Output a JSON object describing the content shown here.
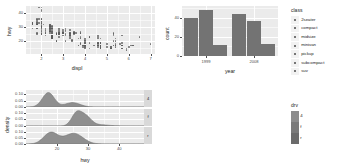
{
  "chart_data": [
    {
      "id": "scatter-displ-hwy",
      "type": "scatter",
      "title": "",
      "xlabel": "displ",
      "ylabel": "hwy",
      "xlim": [
        1.3,
        7.2
      ],
      "ylim": [
        11,
        45
      ],
      "xticks": [
        2,
        3,
        4,
        5,
        6,
        7
      ],
      "yticks": [
        20,
        30,
        40
      ],
      "grid": true,
      "legend": "right",
      "points": [
        [
          1.8,
          29
        ],
        [
          1.8,
          29
        ],
        [
          2.0,
          31
        ],
        [
          2.0,
          30
        ],
        [
          2.8,
          26
        ],
        [
          2.8,
          26
        ],
        [
          3.1,
          27
        ],
        [
          1.8,
          26
        ],
        [
          1.8,
          25
        ],
        [
          2.0,
          28
        ],
        [
          2.0,
          27
        ],
        [
          2.8,
          25
        ],
        [
          2.8,
          25
        ],
        [
          3.1,
          25
        ],
        [
          3.1,
          24
        ],
        [
          2.8,
          23
        ],
        [
          3.1,
          20
        ],
        [
          4.2,
          15
        ],
        [
          5.3,
          20
        ],
        [
          5.3,
          17
        ],
        [
          5.3,
          17
        ],
        [
          5.7,
          17
        ],
        [
          6.0,
          16
        ],
        [
          5.7,
          17
        ],
        [
          5.7,
          17
        ],
        [
          6.2,
          17
        ],
        [
          6.2,
          17
        ],
        [
          7.0,
          18
        ],
        [
          5.3,
          25
        ],
        [
          5.3,
          24
        ],
        [
          5.7,
          24
        ],
        [
          6.5,
          23
        ],
        [
          2.4,
          31
        ],
        [
          2.4,
          30
        ],
        [
          3.1,
          28
        ],
        [
          3.5,
          27
        ],
        [
          3.6,
          26
        ],
        [
          2.4,
          27
        ],
        [
          3.0,
          26
        ],
        [
          3.3,
          25
        ],
        [
          3.3,
          25
        ],
        [
          3.3,
          24
        ],
        [
          3.3,
          24
        ],
        [
          3.3,
          22
        ],
        [
          3.8,
          23
        ],
        [
          3.8,
          22
        ],
        [
          3.8,
          22
        ],
        [
          4.0,
          22
        ],
        [
          3.7,
          17
        ],
        [
          3.7,
          17
        ],
        [
          3.9,
          16
        ],
        [
          3.9,
          17
        ],
        [
          4.7,
          17
        ],
        [
          4.7,
          15
        ],
        [
          4.7,
          15
        ],
        [
          5.2,
          15
        ],
        [
          5.2,
          16
        ],
        [
          3.9,
          17
        ],
        [
          4.7,
          16
        ],
        [
          4.7,
          17
        ],
        [
          4.7,
          15
        ],
        [
          5.2,
          15
        ],
        [
          5.7,
          15
        ],
        [
          5.9,
          14
        ],
        [
          4.7,
          17
        ],
        [
          4.7,
          17
        ],
        [
          4.7,
          17
        ],
        [
          4.7,
          16
        ],
        [
          4.7,
          16
        ],
        [
          4.7,
          17
        ],
        [
          5.2,
          15
        ],
        [
          5.2,
          16
        ],
        [
          5.7,
          15
        ],
        [
          5.9,
          15
        ],
        [
          4.6,
          17
        ],
        [
          5.4,
          16
        ],
        [
          5.4,
          17
        ],
        [
          4.0,
          15
        ],
        [
          4.0,
          17
        ],
        [
          4.0,
          17
        ],
        [
          4.0,
          17
        ],
        [
          4.6,
          16
        ],
        [
          5.0,
          16
        ],
        [
          4.2,
          23
        ],
        [
          4.2,
          23
        ],
        [
          4.6,
          22
        ],
        [
          4.6,
          23
        ],
        [
          4.6,
          24
        ],
        [
          5.4,
          22
        ],
        [
          5.4,
          20
        ],
        [
          3.8,
          19
        ],
        [
          3.8,
          18
        ],
        [
          4.0,
          17
        ],
        [
          4.0,
          17
        ],
        [
          4.6,
          19
        ],
        [
          4.6,
          19
        ],
        [
          4.6,
          18
        ],
        [
          5.4,
          17
        ],
        [
          1.6,
          33
        ],
        [
          1.6,
          33
        ],
        [
          1.6,
          32
        ],
        [
          1.6,
          32
        ],
        [
          1.6,
          29
        ],
        [
          1.8,
          32
        ],
        [
          1.8,
          34
        ],
        [
          1.8,
          36
        ],
        [
          2.0,
          36
        ],
        [
          2.4,
          29
        ],
        [
          2.4,
          26
        ],
        [
          2.4,
          28
        ],
        [
          2.4,
          27
        ],
        [
          2.5,
          30
        ],
        [
          2.5,
          31
        ],
        [
          3.3,
          26
        ],
        [
          2.0,
          26
        ],
        [
          2.0,
          25
        ],
        [
          2.0,
          27
        ],
        [
          2.0,
          25
        ],
        [
          2.7,
          26
        ],
        [
          2.7,
          25
        ],
        [
          2.7,
          25
        ],
        [
          3.0,
          24
        ],
        [
          3.7,
          22
        ],
        [
          4.0,
          19
        ],
        [
          4.7,
          19
        ],
        [
          4.7,
          19
        ],
        [
          4.7,
          19
        ],
        [
          5.7,
          19
        ],
        [
          6.1,
          17
        ],
        [
          4.0,
          19
        ],
        [
          4.2,
          19
        ],
        [
          4.4,
          17
        ],
        [
          4.6,
          17
        ],
        [
          5.4,
          18
        ],
        [
          5.4,
          17
        ],
        [
          5.4,
          17
        ],
        [
          4.0,
          16
        ],
        [
          4.0,
          16
        ],
        [
          4.6,
          17
        ],
        [
          5.0,
          18
        ],
        [
          2.4,
          31
        ],
        [
          2.4,
          32
        ],
        [
          2.5,
          29
        ],
        [
          2.5,
          29
        ],
        [
          3.3,
          28
        ],
        [
          2.0,
          33
        ],
        [
          2.0,
          34
        ],
        [
          2.0,
          33
        ],
        [
          2.1,
          32
        ],
        [
          2.4,
          31
        ],
        [
          2.4,
          29
        ],
        [
          2.5,
          28
        ],
        [
          2.5,
          29
        ],
        [
          2.4,
          32
        ],
        [
          2.4,
          30
        ],
        [
          2.5,
          27
        ],
        [
          2.5,
          27
        ],
        [
          3.5,
          26
        ],
        [
          3.5,
          26
        ],
        [
          3.0,
          26
        ],
        [
          3.0,
          26
        ],
        [
          3.5,
          25
        ],
        [
          3.3,
          24
        ],
        [
          3.3,
          23
        ],
        [
          4.0,
          20
        ],
        [
          5.6,
          18
        ],
        [
          3.1,
          29
        ],
        [
          3.8,
          26
        ],
        [
          3.8,
          26
        ],
        [
          3.8,
          27
        ],
        [
          5.3,
          26
        ],
        [
          2.5,
          23
        ],
        [
          2.5,
          24
        ],
        [
          2.5,
          22
        ],
        [
          2.5,
          23
        ],
        [
          2.5,
          24
        ],
        [
          2.5,
          22
        ],
        [
          2.5,
          22
        ],
        [
          2.5,
          24
        ],
        [
          2.5,
          23
        ],
        [
          2.2,
          24
        ],
        [
          2.2,
          26
        ],
        [
          2.5,
          24
        ],
        [
          2.5,
          22
        ],
        [
          2.5,
          23
        ],
        [
          2.5,
          23
        ],
        [
          2.5,
          23
        ],
        [
          2.5,
          24
        ],
        [
          2.7,
          20
        ],
        [
          2.7,
          20
        ],
        [
          3.4,
          20
        ],
        [
          3.4,
          21
        ],
        [
          4.0,
          21
        ],
        [
          4.7,
          22
        ],
        [
          2.2,
          27
        ],
        [
          2.2,
          26
        ],
        [
          2.4,
          27
        ],
        [
          2.4,
          27
        ],
        [
          3.0,
          26
        ],
        [
          3.0,
          26
        ],
        [
          3.5,
          26
        ],
        [
          2.2,
          29
        ],
        [
          2.2,
          28
        ],
        [
          2.4,
          29
        ],
        [
          2.4,
          28
        ],
        [
          3.0,
          28
        ],
        [
          3.0,
          27
        ],
        [
          3.3,
          26
        ],
        [
          1.8,
          35
        ],
        [
          1.8,
          33
        ],
        [
          1.8,
          32
        ],
        [
          1.8,
          33
        ],
        [
          1.8,
          32
        ],
        [
          1.8,
          32
        ],
        [
          2.0,
          31
        ],
        [
          2.0,
          30
        ],
        [
          2.0,
          29
        ],
        [
          2.0,
          32
        ],
        [
          2.0,
          29
        ],
        [
          2.8,
          26
        ],
        [
          1.9,
          44
        ],
        [
          2.0,
          44
        ],
        [
          2.0,
          42
        ],
        [
          2.0,
          41
        ],
        [
          2.5,
          29
        ],
        [
          2.5,
          26
        ],
        [
          2.8,
          28
        ],
        [
          2.8,
          29
        ],
        [
          1.9,
          36
        ],
        [
          1.9,
          33
        ],
        [
          2.0,
          34
        ],
        [
          2.0,
          36
        ],
        [
          2.5,
          23
        ],
        [
          2.5,
          26
        ],
        [
          2.8,
          27
        ],
        [
          2.8,
          25
        ],
        [
          1.6,
          33
        ],
        [
          1.6,
          32
        ]
      ]
    },
    {
      "id": "bar-year-class",
      "type": "bar",
      "title": "",
      "xlabel": "year",
      "ylabel": "count",
      "categories": [
        "1999",
        "2008"
      ],
      "yticks": [
        0,
        20,
        40
      ],
      "ylim": [
        0,
        52
      ],
      "grid": true,
      "groups": [
        {
          "category": "1999",
          "values": [
            40,
            48,
            11
          ]
        },
        {
          "category": "2008",
          "values": [
            44,
            36,
            12
          ]
        }
      ]
    },
    {
      "id": "density-hwy-by-drv",
      "type": "area",
      "title": "",
      "xlabel": "hwy",
      "ylabel": "density",
      "xticks": [
        20,
        30,
        40
      ],
      "yticks": [
        "0.00",
        "0.05",
        "0.10"
      ],
      "xlim": [
        10,
        48
      ],
      "ylim": [
        0,
        0.135
      ],
      "grid": true,
      "facets": [
        {
          "label": "4",
          "peak": 0.115,
          "curve": "bimodal, main mode near hwy 17, secondary mode near hwy 25"
        },
        {
          "label": "f",
          "peak": 0.122,
          "curve": "bimodal, modes near hwy 26 and hwy 29"
        },
        {
          "label": "r",
          "peak": 0.095,
          "curve": "bimodal, broad, modes near hwy 18 and hwy 25"
        }
      ]
    }
  ],
  "legends": [
    {
      "title": "class",
      "type": "discrete",
      "items": [
        {
          "label": "2seater"
        },
        {
          "label": "compact"
        },
        {
          "label": "midsize"
        },
        {
          "label": "minivan"
        },
        {
          "label": "pickup"
        },
        {
          "label": "subcompact"
        },
        {
          "label": "suv"
        }
      ]
    },
    {
      "title": "drv",
      "type": "colorbar",
      "items": [
        {
          "label": "4"
        },
        {
          "label": "f"
        },
        {
          "label": "r"
        }
      ],
      "colors": [
        "#8c8c8c",
        "#7a7a7a",
        "#6b6b6b"
      ]
    }
  ],
  "colors": {
    "panel_background": "#ebebeb",
    "grid_line": "#ffffff",
    "bar_fill": "#737373",
    "point_fill": "#595959",
    "strip_background": "#d9d9d9",
    "text": "#4d4d4d"
  }
}
